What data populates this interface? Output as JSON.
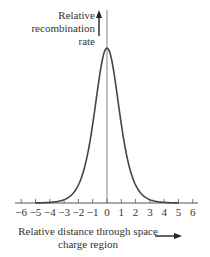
{
  "figure": {
    "y_label_lines": [
      "Relative",
      "recombination",
      "rate"
    ],
    "x_label_lines": [
      "Relative distance through space",
      "charge region"
    ],
    "tick_labels": [
      "−6",
      "−5",
      "−4",
      "−3",
      "−2",
      "−1",
      "0",
      "1",
      "2",
      "3",
      "4",
      "5",
      "6"
    ]
  },
  "chart_data": {
    "type": "line",
    "title": "",
    "xlabel": "Relative distance through space charge region",
    "ylabel": "Relative recombination rate",
    "xlim": [
      -6,
      6
    ],
    "x_ticks": [
      -6,
      -5,
      -4,
      -3,
      -2,
      -1,
      0,
      1,
      2,
      3,
      4,
      5,
      6
    ],
    "grid": false,
    "series": [
      {
        "name": "recombination rate",
        "x": [
          -5,
          -4,
          -3,
          -2,
          -1.5,
          -1,
          -0.5,
          0,
          0.5,
          1,
          1.5,
          2,
          3,
          4,
          5
        ],
        "y": [
          0.02,
          0.06,
          0.16,
          0.4,
          0.6,
          0.8,
          0.95,
          1.0,
          0.95,
          0.8,
          0.6,
          0.4,
          0.16,
          0.06,
          0.02
        ]
      }
    ]
  }
}
